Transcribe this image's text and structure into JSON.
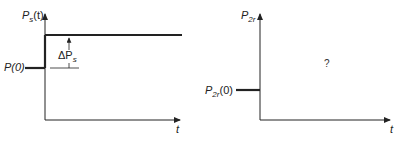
{
  "left_plot": {
    "y_axis_label": "P",
    "y_axis_sub": "s",
    "y_axis_arg": "(t)",
    "x_axis_label": "t",
    "initial_label": "P(0)",
    "delta_label": "ΔP",
    "delta_sub": "s"
  },
  "right_plot": {
    "y_axis_label": "P",
    "y_axis_sub": "2r",
    "x_axis_label": "t",
    "initial_label_main": "P",
    "initial_label_sub": "2r",
    "initial_label_arg": "(0)",
    "unknown_marker": "?"
  }
}
